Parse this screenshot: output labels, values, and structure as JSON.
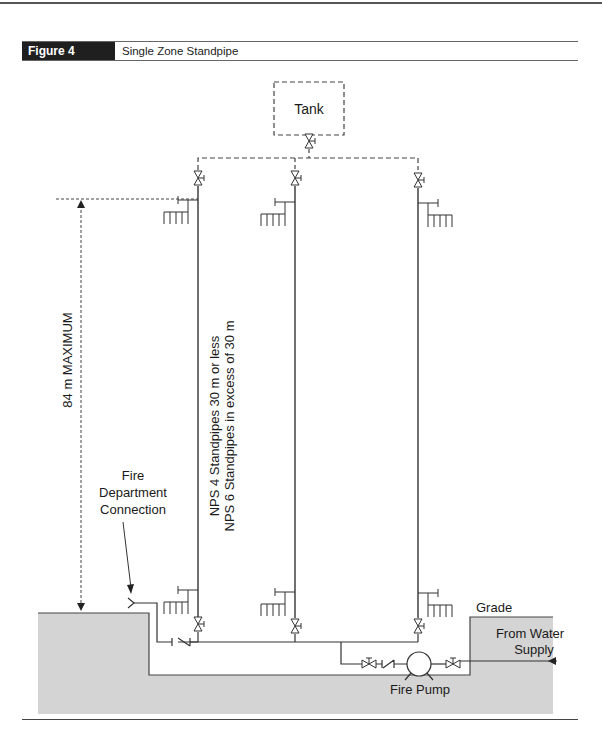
{
  "figure": {
    "number_label": "Figure 4",
    "title": "Single Zone Standpipe"
  },
  "diagram": {
    "tank_label": "Tank",
    "height_label": "84 m MAXIMUM",
    "standpipe_note_line1": "NPS 4 Standpipes 30 m or less",
    "standpipe_note_line2": "NPS 6 Standpipes in excess of 30 m",
    "fdc_label_line1": "Fire",
    "fdc_label_line2": "Department",
    "fdc_label_line3": "Connection",
    "grade_label": "Grade",
    "water_supply_line1": "From Water",
    "water_supply_line2": "Supply",
    "pump_label": "Fire Pump",
    "colors": {
      "ground": "#d4d4d4",
      "line": "#333333",
      "header_bg": "#1f1f1f"
    }
  }
}
